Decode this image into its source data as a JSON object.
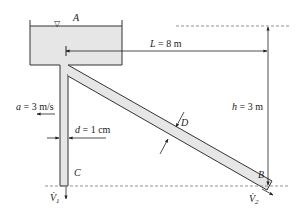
{
  "figure": {
    "tank_label": "A",
    "free_surface_symbol": "▽",
    "length_label": "L = 8 m",
    "height_label": "h = 3 m",
    "acceleration_label": "a = 3 m/s",
    "small_diameter_label": "d = 1 cm",
    "large_diameter_label": "D",
    "outlet_vertical_label": "C",
    "outlet_inclined_label": "B",
    "flow_vertical_label": "V̇",
    "flow_vertical_sub": "1",
    "flow_inclined_label": "V̇",
    "flow_inclined_sub": "2"
  },
  "colors": {
    "line": "#333333",
    "fluid": "#e6e6e6",
    "dashed": "#777777"
  }
}
